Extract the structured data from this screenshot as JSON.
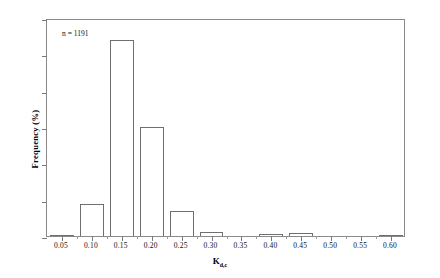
{
  "chart": {
    "annotation": "n = 1191",
    "x_axis_title_main": "K",
    "x_axis_title_sub": "d,c",
    "y_axis_title": "Frequency (%)"
  },
  "chart_data": {
    "type": "bar",
    "title": "",
    "xlabel": "Kd,c",
    "ylabel": "Frequency (%)",
    "annotations": [
      "n = 1191"
    ],
    "grid": false,
    "legend": "none",
    "xlim": [
      0.025,
      0.625
    ],
    "ylim": [
      0,
      60
    ],
    "ytick_labels": [
      "0%",
      "10%",
      "20%",
      "30%",
      "40%",
      "50%",
      "60%"
    ],
    "ytick_values": [
      0,
      10,
      20,
      30,
      40,
      50,
      60
    ],
    "xtick_labels": [
      "0.05",
      "0.10",
      "0.15",
      "0.20",
      "0.25",
      "0.30",
      "0.35",
      "0.40",
      "0.45",
      "0.50",
      "0.55",
      "0.60"
    ],
    "categories": [
      0.05,
      0.1,
      0.15,
      0.2,
      0.25,
      0.3,
      0.35,
      0.4,
      0.45,
      0.5,
      0.55,
      0.6
    ],
    "values": [
      0.4,
      8.8,
      54.0,
      30.0,
      6.9,
      1.2,
      0.0,
      0.5,
      0.8,
      0.0,
      0.0,
      0.4
    ]
  }
}
